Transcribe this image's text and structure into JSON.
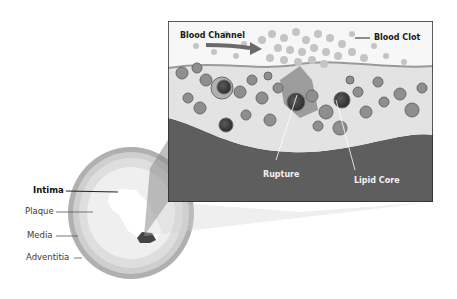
{
  "figure": {
    "cross_section_labels": [
      {
        "id": "intima",
        "text": "Intima",
        "bold": true
      },
      {
        "id": "plaque",
        "text": "Plaque",
        "bold": false
      },
      {
        "id": "media",
        "text": "Media",
        "bold": false
      },
      {
        "id": "adventitia",
        "text": "Adventitia",
        "bold": false
      }
    ],
    "inset_labels": {
      "blood_channel": "Blood Channel",
      "blood_clot": "Blood Clot",
      "rupture": "Rupture",
      "lipid_core": "Lipid Core"
    }
  },
  "colors": {
    "frame_border": "#2a2a2a",
    "vessel_wall_dark": "#5c5c5c",
    "plaque_light": "#e6e6e6",
    "cells_mid": "#8a8a8a",
    "clot_particles": "#b8b8b8",
    "adventitia_ring": "#a8a8a8",
    "media_ring": "#d4d4d4",
    "cone": "#9a9a9a"
  }
}
